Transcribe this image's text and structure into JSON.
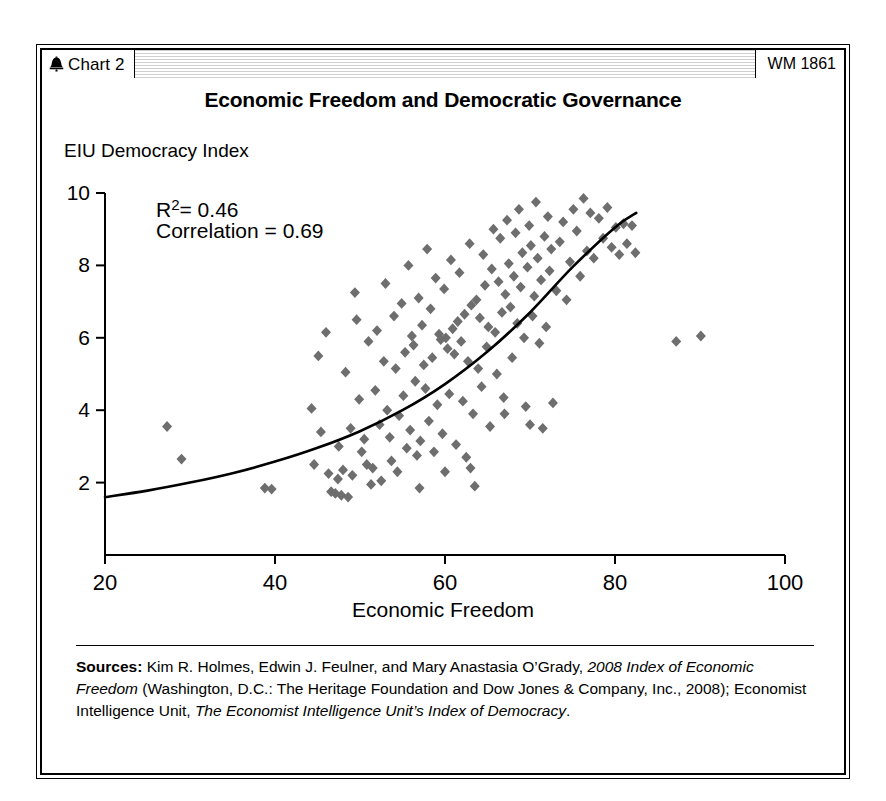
{
  "header": {
    "bell_icon": "liberty-bell-icon",
    "chart_tag": "Chart 2",
    "wm_tag": "WM 1861"
  },
  "title": "Economic Freedom and Democratic Governance",
  "footer": {
    "sources_label": "Sources:",
    "seg1": " Kim R. Holmes, Edwin J. Feulner, and Mary Anastasia O’Grady, ",
    "seg2_italic": "2008 Index of Economic Freedom",
    "seg3": " (Washington, D.C.: The Heritage Foundation and Dow Jones & Company, Inc., 2008); Economist Intelligence Unit, ",
    "seg4_italic": "The Economist Intelligence Unit’s Index of Democracy",
    "seg5": "."
  },
  "colors": {
    "marker": "#6e6e6e",
    "axis": "#000000",
    "curve": "#000000",
    "background": "#ffffff",
    "header_hatch": "#cfcfcf"
  },
  "chart_data": {
    "type": "scatter",
    "title": "Economic Freedom and Democratic Governance",
    "xlabel": "Economic Freedom",
    "ylabel": "EIU Democracy Index",
    "xlim": [
      20,
      100
    ],
    "ylim": [
      0,
      10
    ],
    "xticks": [
      20,
      40,
      60,
      80,
      100
    ],
    "yticks": [
      2,
      4,
      6,
      8,
      10
    ],
    "grid": false,
    "legend": null,
    "marker_shape": "diamond",
    "marker_color": "#6e6e6e",
    "annotations": [
      {
        "text": "R²= 0.46",
        "x": 26,
        "y": 9.35
      },
      {
        "text": "Correlation = 0.69",
        "x": 26,
        "y": 8.75
      }
    ],
    "statistics": {
      "r_squared": 0.46,
      "correlation": 0.69
    },
    "trendline": {
      "type": "exponential",
      "label": "fitted curve",
      "x_start": 20,
      "x_end": 82.5,
      "points": [
        [
          20,
          1.6
        ],
        [
          25,
          1.78
        ],
        [
          30,
          2.0
        ],
        [
          35,
          2.26
        ],
        [
          40,
          2.58
        ],
        [
          45,
          2.96
        ],
        [
          50,
          3.42
        ],
        [
          55,
          4.0
        ],
        [
          60,
          4.72
        ],
        [
          65,
          5.62
        ],
        [
          70,
          6.7
        ],
        [
          75,
          7.95
        ],
        [
          80,
          9.05
        ],
        [
          82.5,
          9.45
        ]
      ]
    },
    "points": [
      [
        27.3,
        3.55
      ],
      [
        29.0,
        2.65
      ],
      [
        38.8,
        1.85
      ],
      [
        39.6,
        1.82
      ],
      [
        44.3,
        4.05
      ],
      [
        44.6,
        2.5
      ],
      [
        45.1,
        5.5
      ],
      [
        45.4,
        3.4
      ],
      [
        46.0,
        6.15
      ],
      [
        46.3,
        2.25
      ],
      [
        46.6,
        1.75
      ],
      [
        47.1,
        1.7
      ],
      [
        47.4,
        2.1
      ],
      [
        47.5,
        3.0
      ],
      [
        47.8,
        1.65
      ],
      [
        48.0,
        2.35
      ],
      [
        48.3,
        5.05
      ],
      [
        48.6,
        1.6
      ],
      [
        48.9,
        3.5
      ],
      [
        49.1,
        2.2
      ],
      [
        49.4,
        7.25
      ],
      [
        49.6,
        6.5
      ],
      [
        49.9,
        4.3
      ],
      [
        50.2,
        2.85
      ],
      [
        50.5,
        3.2
      ],
      [
        50.8,
        2.5
      ],
      [
        51.0,
        5.9
      ],
      [
        51.3,
        1.95
      ],
      [
        51.5,
        2.4
      ],
      [
        51.8,
        4.55
      ],
      [
        52.0,
        6.2
      ],
      [
        52.3,
        3.6
      ],
      [
        52.5,
        2.05
      ],
      [
        52.8,
        5.35
      ],
      [
        53.0,
        7.5
      ],
      [
        53.2,
        4.0
      ],
      [
        53.5,
        3.25
      ],
      [
        53.7,
        2.6
      ],
      [
        54.0,
        6.6
      ],
      [
        54.2,
        5.15
      ],
      [
        54.4,
        2.3
      ],
      [
        54.6,
        3.85
      ],
      [
        54.9,
        6.95
      ],
      [
        55.1,
        4.4
      ],
      [
        55.3,
        5.6
      ],
      [
        55.5,
        2.95
      ],
      [
        55.7,
        8.0
      ],
      [
        55.9,
        3.45
      ],
      [
        56.1,
        6.05
      ],
      [
        56.3,
        5.8
      ],
      [
        56.5,
        4.8
      ],
      [
        56.7,
        2.75
      ],
      [
        56.9,
        7.1
      ],
      [
        57.1,
        3.15
      ],
      [
        57.3,
        6.35
      ],
      [
        57.5,
        5.25
      ],
      [
        57.7,
        4.6
      ],
      [
        57.9,
        8.45
      ],
      [
        58.1,
        3.7
      ],
      [
        58.3,
        6.8
      ],
      [
        58.5,
        5.45
      ],
      [
        58.7,
        2.85
      ],
      [
        58.9,
        7.65
      ],
      [
        59.1,
        4.15
      ],
      [
        59.3,
        6.1
      ],
      [
        59.5,
        5.95
      ],
      [
        59.7,
        3.35
      ],
      [
        59.9,
        7.35
      ],
      [
        60.1,
        6.0
      ],
      [
        60.3,
        5.7
      ],
      [
        60.5,
        4.45
      ],
      [
        60.7,
        8.15
      ],
      [
        60.9,
        6.25
      ],
      [
        61.1,
        5.55
      ],
      [
        61.3,
        3.05
      ],
      [
        61.5,
        6.45
      ],
      [
        61.7,
        7.8
      ],
      [
        61.9,
        5.9
      ],
      [
        62.1,
        4.25
      ],
      [
        62.3,
        6.65
      ],
      [
        62.5,
        2.7
      ],
      [
        62.7,
        5.35
      ],
      [
        62.9,
        8.6
      ],
      [
        63.1,
        6.9
      ],
      [
        63.3,
        3.9
      ],
      [
        63.5,
        1.9
      ],
      [
        63.7,
        7.05
      ],
      [
        63.9,
        5.15
      ],
      [
        64.1,
        6.55
      ],
      [
        64.3,
        4.65
      ],
      [
        64.5,
        8.3
      ],
      [
        64.7,
        7.45
      ],
      [
        64.9,
        5.75
      ],
      [
        65.1,
        6.3
      ],
      [
        65.3,
        3.55
      ],
      [
        65.5,
        7.9
      ],
      [
        65.7,
        9.0
      ],
      [
        65.9,
        6.15
      ],
      [
        66.1,
        5.0
      ],
      [
        66.3,
        7.55
      ],
      [
        66.5,
        8.75
      ],
      [
        66.7,
        6.7
      ],
      [
        66.9,
        4.35
      ],
      [
        67.1,
        7.2
      ],
      [
        67.3,
        9.25
      ],
      [
        67.5,
        8.05
      ],
      [
        67.7,
        6.85
      ],
      [
        67.9,
        5.45
      ],
      [
        68.1,
        7.7
      ],
      [
        68.3,
        8.9
      ],
      [
        68.5,
        6.4
      ],
      [
        68.7,
        9.55
      ],
      [
        68.9,
        7.4
      ],
      [
        69.1,
        8.35
      ],
      [
        69.3,
        6.0
      ],
      [
        69.5,
        4.1
      ],
      [
        69.7,
        7.95
      ],
      [
        69.9,
        9.1
      ],
      [
        70.1,
        8.55
      ],
      [
        70.3,
        6.6
      ],
      [
        70.5,
        7.15
      ],
      [
        70.7,
        9.75
      ],
      [
        70.9,
        8.2
      ],
      [
        71.1,
        5.85
      ],
      [
        71.3,
        7.6
      ],
      [
        71.5,
        3.5
      ],
      [
        71.7,
        8.8
      ],
      [
        71.9,
        6.3
      ],
      [
        72.1,
        9.35
      ],
      [
        72.3,
        7.85
      ],
      [
        72.5,
        8.45
      ],
      [
        72.7,
        4.2
      ],
      [
        73.1,
        7.3
      ],
      [
        73.5,
        8.65
      ],
      [
        73.9,
        9.2
      ],
      [
        74.3,
        7.05
      ],
      [
        74.7,
        8.1
      ],
      [
        75.1,
        9.55
      ],
      [
        75.5,
        8.95
      ],
      [
        75.9,
        7.7
      ],
      [
        76.3,
        9.85
      ],
      [
        76.7,
        8.4
      ],
      [
        77.1,
        9.45
      ],
      [
        77.5,
        8.2
      ],
      [
        78.1,
        9.3
      ],
      [
        78.6,
        8.75
      ],
      [
        79.1,
        9.6
      ],
      [
        79.6,
        8.5
      ],
      [
        80.1,
        9.05
      ],
      [
        80.5,
        8.3
      ],
      [
        81.0,
        9.15
      ],
      [
        81.4,
        8.6
      ],
      [
        82.0,
        9.1
      ],
      [
        82.4,
        8.35
      ],
      [
        70.0,
        3.6
      ],
      [
        67.0,
        3.9
      ],
      [
        63.0,
        2.4
      ],
      [
        60.0,
        2.3
      ],
      [
        57.0,
        1.85
      ],
      [
        87.2,
        5.9
      ],
      [
        90.1,
        6.05
      ]
    ]
  }
}
